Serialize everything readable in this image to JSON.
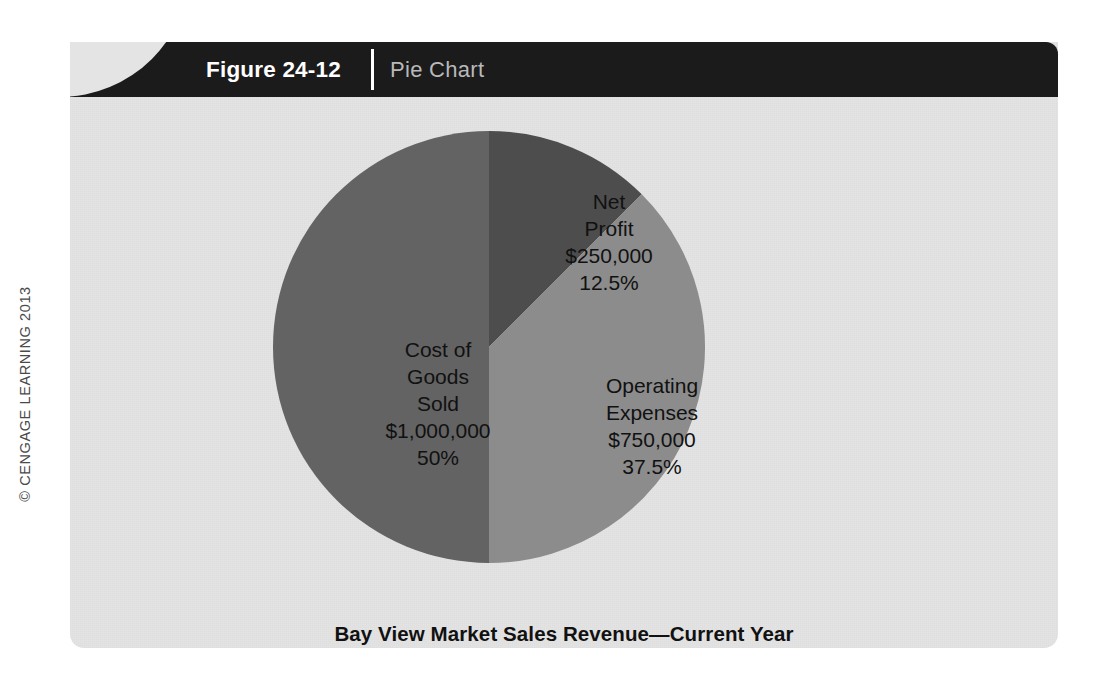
{
  "copyright": {
    "text": "© CENGAGE LEARNING 2013"
  },
  "figure": {
    "number_label": "Figure 24-12",
    "type_label": "Pie Chart"
  },
  "chart_data": {
    "type": "pie",
    "title": "Bay View Market Sales Revenue—Current Year",
    "xlabel": "",
    "ylabel": "",
    "grid": false,
    "legend_position": "none",
    "labels_inside_slices": true,
    "start_angle_deg": 0,
    "direction": "clockwise",
    "categories": [
      "Net Profit",
      "Operating Expenses",
      "Cost of Goods Sold"
    ],
    "values": [
      250000,
      750000,
      1000000
    ],
    "percents": [
      12.5,
      37.5,
      50
    ],
    "total": 2000000,
    "colors": [
      "#4d4d4d",
      "#8c8c8c",
      "#636363"
    ],
    "slices": [
      {
        "name": "Net Profit",
        "label": "Net\nProfit\n$250,000\n12.5%",
        "value": 250000,
        "value_text": "$250,000",
        "percent": 12.5,
        "percent_text": "12.5%",
        "color": "#4d4d4d"
      },
      {
        "name": "Operating Expenses",
        "label": "Operating\nExpenses\n$750,000\n37.5%",
        "value": 750000,
        "value_text": "$750,000",
        "percent": 37.5,
        "percent_text": "37.5%",
        "color": "#8c8c8c"
      },
      {
        "name": "Cost of Goods Sold",
        "label": "Cost of\nGoods\nSold\n$1,000,000\n50%",
        "value": 1000000,
        "value_text": "$1,000,000",
        "percent": 50,
        "percent_text": "50%",
        "color": "#636363"
      }
    ]
  },
  "theme": {
    "page_background": "#ffffff",
    "panel_background": "#e4e4e4",
    "header_background": "#1b1b1b",
    "header_number_color": "#ffffff",
    "header_type_color": "#b9b9b9",
    "text_color": "#111111"
  }
}
